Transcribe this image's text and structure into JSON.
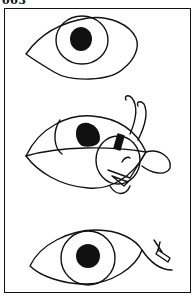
{
  "panel": {
    "label": "003",
    "frame_color": "#111111",
    "background": "#ffffff"
  },
  "illustration": {
    "subject": "eye transformation sequence",
    "figures": [
      {
        "name": "top-eye",
        "description": "open eye with iris and pupil"
      },
      {
        "name": "middle-eye-creature",
        "description": "eye morphing into a bug-like creature with antennae, wings and face"
      },
      {
        "name": "bottom-eye",
        "description": "open eye with small object near outer corner"
      }
    ],
    "stroke_color": "#111111"
  }
}
